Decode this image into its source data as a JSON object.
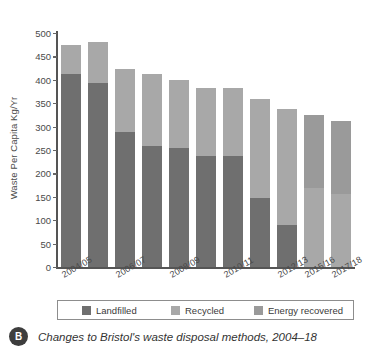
{
  "chart_data": {
    "type": "bar",
    "stacked": true,
    "title": "",
    "xlabel": "",
    "ylabel": "Waste Per Capita Kg/Yr",
    "ylim": [
      0,
      500
    ],
    "ytick_step": 50,
    "yticks": [
      "500",
      "450",
      "400",
      "350",
      "300",
      "250",
      "200",
      "150",
      "100",
      "50",
      "0"
    ],
    "grid": false,
    "legend_position": "bottom",
    "categories": [
      "2004/05",
      "2005/06",
      "2006/07",
      "2007/08",
      "2008/09",
      "2009/10",
      "2010/11",
      "2011/12",
      "2012/13",
      "2015/16",
      "2017/18"
    ],
    "visible_tick_labels": [
      "2004/05",
      "2006/07",
      "2008/09",
      "2010/11",
      "2012/13",
      "2015/16",
      "2017/18"
    ],
    "series": [
      {
        "name": "Landfilled",
        "color": "#6f6f6f",
        "values": [
          413,
          393,
          288,
          258,
          254,
          237,
          238,
          147,
          90,
          0,
          0
        ]
      },
      {
        "name": "Recycled",
        "color": "#a8a8a8",
        "values": [
          61,
          87,
          135,
          154,
          146,
          146,
          145,
          213,
          248,
          168,
          157
        ]
      },
      {
        "name": "Energy recovered",
        "color": "#9a9a9a",
        "values": [
          0,
          0,
          0,
          0,
          0,
          0,
          0,
          0,
          0,
          156,
          156
        ]
      }
    ],
    "totals": [
      474,
      480,
      423,
      412,
      400,
      383,
      383,
      360,
      338,
      324,
      313
    ]
  },
  "legend": {
    "items": [
      {
        "label": "Landfilled",
        "color": "#6f6f6f"
      },
      {
        "label": "Recycled",
        "color": "#a8a8a8"
      },
      {
        "label": "Energy recovered",
        "color": "#9a9a9a"
      }
    ]
  },
  "caption": {
    "badge": "B",
    "text": "Changes to Bristol's waste disposal methods, 2004–18"
  }
}
